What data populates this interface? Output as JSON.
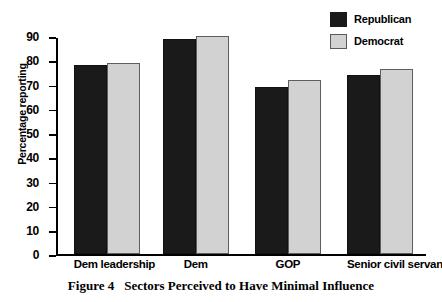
{
  "caption": {
    "number": "Figure 4",
    "text": "Sectors Perceived to Have Minimal Influence"
  },
  "legend": {
    "position": "top-right",
    "entries": [
      {
        "label": "Republican",
        "color": "#1a1a1a"
      },
      {
        "label": "Democrat",
        "color": "#d2d2d2"
      }
    ]
  },
  "chart_data": {
    "type": "bar",
    "title": "Sectors Perceived to Have Minimal Influence",
    "xlabel": "",
    "ylabel": "Percentage reporting",
    "categories": [
      "Dem leadership",
      "Dem",
      "GOP",
      "Senior civil servants"
    ],
    "series": [
      {
        "name": "Republican",
        "color": "#1a1a1a",
        "values": [
          78,
          89,
          69,
          74
        ]
      },
      {
        "name": "Democrat",
        "color": "#d2d2d2",
        "values": [
          79,
          90,
          72,
          76.5
        ]
      }
    ],
    "ylim": [
      0,
      90
    ],
    "ytick_step": 10,
    "yticks": [
      0,
      10,
      20,
      30,
      40,
      50,
      60,
      70,
      80,
      90
    ],
    "ytick_labels": [
      "0",
      "10",
      "20",
      "30",
      "40",
      "50",
      "60",
      "70",
      "80",
      "90"
    ],
    "grid": false,
    "legend_position": "top-right"
  }
}
